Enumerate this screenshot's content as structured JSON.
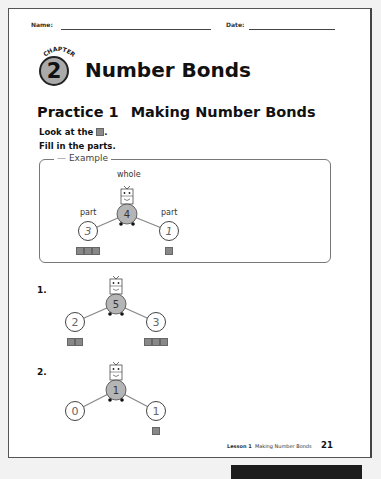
{
  "header": {
    "name_label": "Name:",
    "date_label": "Date:"
  },
  "chapter": {
    "word": "CHAPTER",
    "number": "2",
    "title": "Number Bonds"
  },
  "practice": {
    "label": "Practice 1",
    "title": "Making Number Bonds"
  },
  "instructions": {
    "line1_pre": "Look at the",
    "line1_post": ".",
    "line2": "Fill in the parts."
  },
  "example": {
    "legend": "Example",
    "whole_label": "whole",
    "part_label": "part",
    "whole": "4",
    "left_part": "3",
    "right_part": "1",
    "left_counters": 3,
    "right_counters": 1
  },
  "questions": [
    {
      "number": "1.",
      "whole": "5",
      "left_part": "2",
      "right_part": "3",
      "left_counters": 2,
      "right_counters": 3
    },
    {
      "number": "2.",
      "whole": "1",
      "left_part": "0",
      "right_part": "1",
      "left_counters": 0,
      "right_counters": 1
    }
  ],
  "footer": {
    "lesson": "Lesson 1",
    "lesson_title": "Making Number Bonds",
    "page_number": "21"
  },
  "colors": {
    "counter": "#888888",
    "whole_circle": "#b5b5b5",
    "page_border": "#555555"
  }
}
